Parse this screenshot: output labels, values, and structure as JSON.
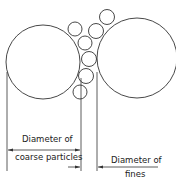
{
  "diagram": {
    "title": "",
    "labels": {
      "coarse_line1": "Diameter of",
      "coarse_line2": "coarse particles",
      "fines_line1": "Diameter of",
      "fines_line2": "fines"
    },
    "coarse_particles": [
      {
        "cx": 43,
        "cy": 62,
        "r": 37
      },
      {
        "cx": 137,
        "cy": 58,
        "r": 40
      }
    ],
    "fine_particles": [
      {
        "cx": 75,
        "cy": 29,
        "r": 7
      },
      {
        "cx": 96,
        "cy": 31,
        "r": 7.5
      },
      {
        "cx": 107,
        "cy": 17,
        "r": 7.5
      },
      {
        "cx": 85,
        "cy": 43,
        "r": 7
      },
      {
        "cx": 89,
        "cy": 59,
        "r": 7.5
      },
      {
        "cx": 86,
        "cy": 76,
        "r": 7.5
      },
      {
        "cx": 80,
        "cy": 92,
        "r": 7
      }
    ],
    "colors": {
      "stroke": "#333333",
      "background": "#ffffff"
    }
  }
}
